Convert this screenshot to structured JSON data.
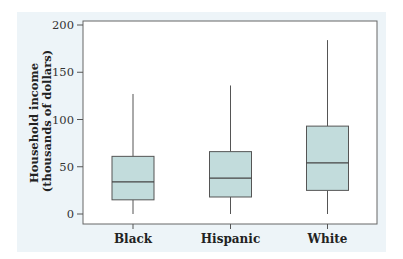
{
  "chart_data": {
    "type": "box",
    "title": "",
    "xlabel": "",
    "ylabel": "Household income (thousands of dollars)",
    "ylabel_lines": [
      "Household income",
      "(thousands of dollars)"
    ],
    "ylim": [
      0,
      200
    ],
    "yticks": [
      0,
      50,
      100,
      150,
      200
    ],
    "grid": false,
    "legend": null,
    "categories": [
      "Black",
      "Hispanic",
      "White"
    ],
    "series": [
      {
        "name": "Black",
        "min": 0,
        "q1": 15,
        "median": 34,
        "q3": 61,
        "max": 127
      },
      {
        "name": "Hispanic",
        "min": 0,
        "q1": 18,
        "median": 38,
        "q3": 66,
        "max": 136
      },
      {
        "name": "White",
        "min": 0,
        "q1": 25,
        "median": 54,
        "q3": 93,
        "max": 184
      }
    ],
    "colors": {
      "box_fill": "#c2dcdc",
      "box_stroke": "#555555",
      "panel_bg": "#edf4f8",
      "plot_bg": "#ffffff"
    }
  }
}
